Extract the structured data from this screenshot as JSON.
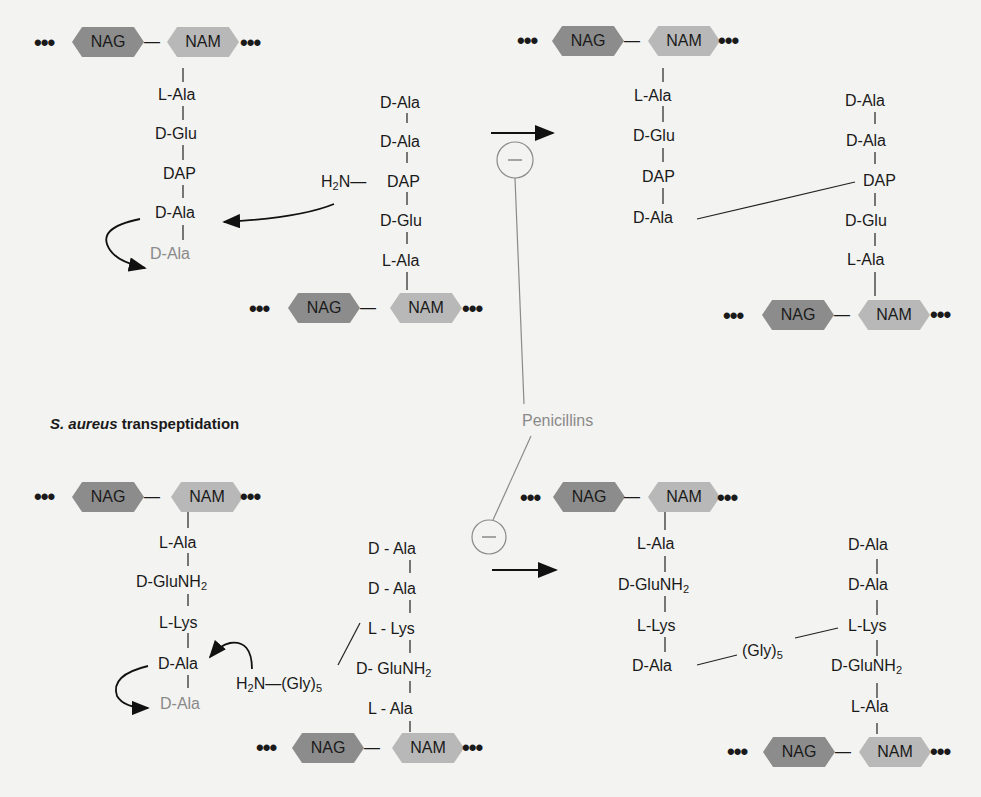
{
  "panels": {
    "top_left": {
      "chain1": {
        "nag": "NAG",
        "nam": "NAM",
        "residues": [
          "L-Ala",
          "D-Glu",
          "DAP",
          "D-Ala",
          "D-Ala"
        ]
      },
      "chain2": {
        "nag": "NAG",
        "nam": "NAM",
        "residues": [
          "D-Ala",
          "D-Ala",
          "DAP",
          "D-Glu",
          "L-Ala"
        ],
        "amine": "H2N—"
      }
    },
    "top_right": {
      "chain1": {
        "nag": "NAG",
        "nam": "NAM",
        "residues": [
          "L-Ala",
          "D-Glu",
          "DAP",
          "D-Ala"
        ]
      },
      "chain2": {
        "nag": "NAG",
        "nam": "NAM",
        "residues": [
          "D-Ala",
          "D-Ala",
          "DAP",
          "D-Glu",
          "L-Ala"
        ]
      }
    },
    "bottom_title": {
      "species": "S. aureus",
      "rest": " transpeptidation"
    },
    "bottom_left": {
      "chain1": {
        "nag": "NAG",
        "nam": "NAM",
        "residues": [
          "L-Ala",
          "D-GluNH2",
          "L-Lys",
          "D-Ala",
          "D-Ala"
        ]
      },
      "chain2": {
        "nag": "NAG",
        "nam": "NAM",
        "residues": [
          "D - Ala",
          "D - Ala",
          "L - Lys",
          "D- GluNH2",
          "L - Ala"
        ],
        "amine": "H2N—(Gly)5"
      }
    },
    "bottom_right": {
      "chain1": {
        "nag": "NAG",
        "nam": "NAM",
        "residues": [
          "L-Ala",
          "D-GluNH2",
          "L-Lys",
          "D-Ala"
        ]
      },
      "bridge": "(Gly)5",
      "chain2": {
        "nag": "NAG",
        "nam": "NAM",
        "residues": [
          "D-Ala",
          "D-Ala",
          "L-Lys",
          "D-GluNH2",
          "L-Ala"
        ]
      }
    }
  },
  "inhibitor": {
    "label": "Penicillins",
    "symbol": "−"
  },
  "dots": "•••",
  "dash": "—",
  "colors": {
    "nag": "#8c8c8c",
    "nam": "#b8b8b8",
    "inhibitor": "#8a8a8a",
    "background": "#f3f3f1"
  }
}
